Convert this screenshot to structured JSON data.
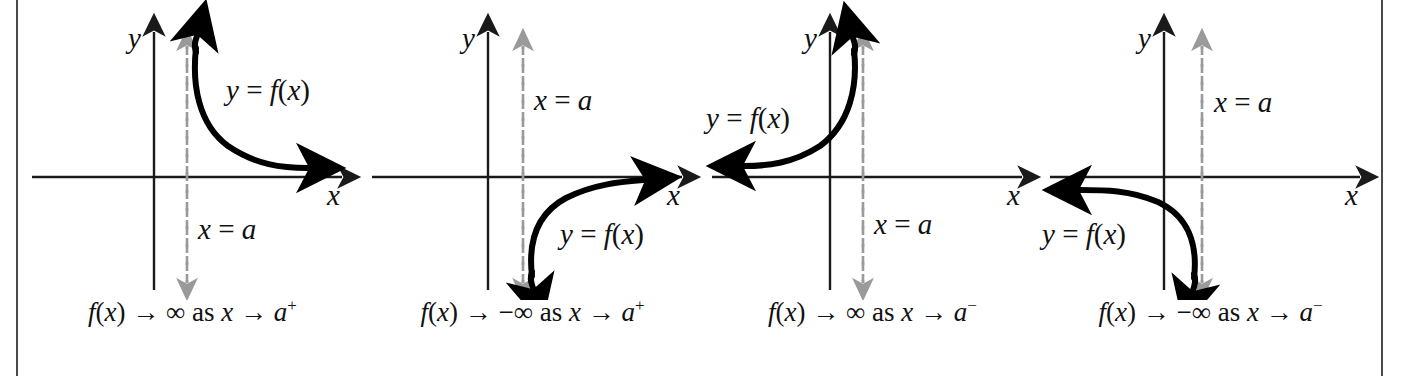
{
  "figure": {
    "background_color": "#ffffff",
    "axis_color": "#1a1a1a",
    "curve_color": "#000000",
    "asymptote_color": "#9a9a9a",
    "rule_color": "#4a4a4a"
  },
  "chart_data": {
    "type": "line",
    "xlabel": "x",
    "ylabel": "y",
    "grid": false,
    "legend": "inline-curve-labels",
    "panels": [
      {
        "id": "panel-1",
        "axis_x_label": "x",
        "axis_y_label": "y",
        "asymptote_label": "x = a",
        "curve_label": "y = f(x)",
        "caption": {
          "full": "f(x) → ∞ as x → a⁺",
          "function": "f(x)",
          "arrow": "→",
          "limit_value": "∞",
          "connector": "as",
          "variable": "x",
          "approach": "a",
          "side": "+"
        },
        "branch": "right",
        "direction": "up",
        "description": "Curve lies right of x = a, rises to +infinity hugging the asymptote, decays toward the positive x-axis."
      },
      {
        "id": "panel-2",
        "axis_x_label": "x",
        "axis_y_label": "y",
        "asymptote_label": "x = a",
        "curve_label": "y = f(x)",
        "caption": {
          "full": "f(x) → −∞ as x → a⁺",
          "function": "f(x)",
          "arrow": "→",
          "limit_value": "−∞",
          "connector": "as",
          "variable": "x",
          "approach": "a",
          "side": "+"
        },
        "branch": "right",
        "direction": "down",
        "description": "Curve lies right of x = a, falls to -infinity hugging the asymptote, rises toward the positive x-axis."
      },
      {
        "id": "panel-3",
        "axis_x_label": "x",
        "axis_y_label": "y",
        "asymptote_label": "x = a",
        "curve_label": "y = f(x)",
        "caption": {
          "full": "f(x) → ∞ as x → a⁻",
          "function": "f(x)",
          "arrow": "→",
          "limit_value": "∞",
          "connector": "as",
          "variable": "x",
          "approach": "a",
          "side": "−"
        },
        "branch": "left",
        "direction": "up",
        "description": "Curve lies left of x = a, rises to +infinity hugging the asymptote, decays toward the negative x-axis."
      },
      {
        "id": "panel-4",
        "axis_x_label": "x",
        "axis_y_label": "y",
        "asymptote_label": "x = a",
        "curve_label": "y = f(x)",
        "caption": {
          "full": "f(x) → −∞ as x → a⁻",
          "function": "f(x)",
          "arrow": "→",
          "limit_value": "−∞",
          "connector": "as",
          "variable": "x",
          "approach": "a",
          "side": "−"
        },
        "branch": "left",
        "direction": "down",
        "description": "Curve lies left of x = a, falls to -infinity hugging the asymptote, rises toward the negative x-axis."
      }
    ]
  }
}
